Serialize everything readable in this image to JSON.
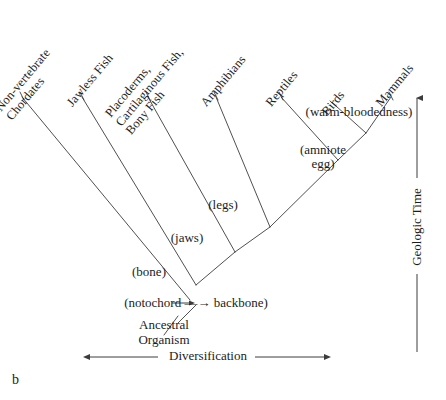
{
  "figure": {
    "panel_letter": "b",
    "type": "cladogram",
    "taxa": [
      {
        "id": "non-vertebrate-chordates",
        "label": "Non-vertebrate\nChordates",
        "x": 22,
        "y": 97,
        "label_x": 14,
        "label_y": 96,
        "rotate": -50
      },
      {
        "id": "jawless-fish",
        "label": "Jawless Fish",
        "x": 82,
        "y": 97,
        "label_x": 75,
        "label_y": 96,
        "rotate": -50
      },
      {
        "id": "placoderms-cartilaginous-bony-fish",
        "label": "Placoderms,\nCartilaginous Fish,\nBony Fish",
        "x": 148,
        "y": 97,
        "label_x": 134,
        "label_y": 97,
        "rotate": -50
      },
      {
        "id": "amphibians",
        "label": "Amphibians",
        "x": 216,
        "y": 97,
        "label_x": 209,
        "label_y": 96,
        "rotate": -50
      },
      {
        "id": "reptiles",
        "label": "Reptiles",
        "x": 281,
        "y": 97,
        "label_x": 274,
        "label_y": 96,
        "rotate": -50
      },
      {
        "id": "birds",
        "label": "Birds",
        "x": 336,
        "y": 106,
        "label_x": 330,
        "label_y": 105,
        "rotate": -50
      },
      {
        "id": "mammals",
        "label": "Mammals",
        "x": 391,
        "y": 97,
        "label_x": 384,
        "label_y": 96,
        "rotate": -50
      }
    ],
    "nodes": [
      {
        "id": "notochord-backbone",
        "label": "(notochord —→ backbone)",
        "x": 196,
        "y": 305,
        "label_x": 118,
        "label_y": 296,
        "label_w": 156
      },
      {
        "id": "bone",
        "label": "(bone)",
        "x": 196,
        "y": 285,
        "label_x": 119,
        "label_y": 265,
        "label_w": 60
      },
      {
        "id": "jaws",
        "label": "(jaws)",
        "x": 235,
        "y": 252,
        "label_x": 157,
        "label_y": 231,
        "label_w": 60
      },
      {
        "id": "legs",
        "label": "(legs)",
        "x": 270,
        "y": 227,
        "label_x": 193,
        "label_y": 198,
        "label_w": 60
      },
      {
        "id": "amniote-egg",
        "label": "(amniote\negg)",
        "x": 338,
        "y": 160,
        "label_x": 290,
        "label_y": 143,
        "label_w": 66
      },
      {
        "id": "warm-bloodedness",
        "label": "(warm-bloodedness)",
        "x": 366,
        "y": 133,
        "label_x": 297,
        "label_y": 105,
        "label_w": 124
      }
    ],
    "ancestral": {
      "label": "Ancestral\nOrganism",
      "x": 124,
      "y": 318,
      "w": 80
    },
    "axes": {
      "horizontal": {
        "label": "Diversification",
        "label_x": 169,
        "label_y": 348,
        "x1": 90,
        "x2": 325,
        "y": 357,
        "gap_left": 158,
        "gap_right": 255
      },
      "vertical": {
        "label": "Geologic Time",
        "x": 417,
        "y1": 98,
        "y2": 352,
        "gap_top": 178,
        "gap_bottom": 274,
        "label_cx": 417,
        "label_cy": 226
      }
    },
    "colors": {
      "background": "#ffffff",
      "line": "#3c3c3c",
      "text": "#1c1c1c"
    }
  }
}
